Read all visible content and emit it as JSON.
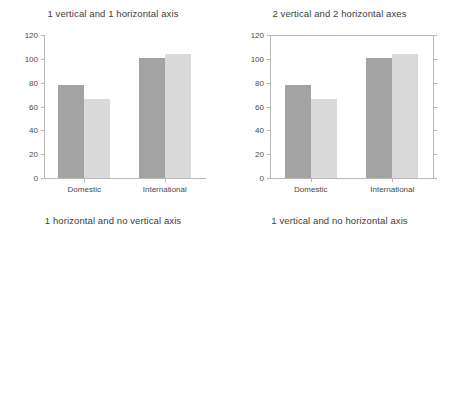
{
  "figure": {
    "layout": "2x2 grid of bar charts",
    "categories": [
      "Domestic",
      "International"
    ],
    "series": [
      {
        "name": "series-1",
        "color": "#a3a3a3",
        "values": [
          78,
          101
        ]
      },
      {
        "name": "series-2",
        "color": "#dadada",
        "values": [
          66,
          104
        ]
      }
    ],
    "y_ticks": [
      "0",
      "20",
      "40",
      "60",
      "80",
      "100",
      "120"
    ],
    "x_ticks": [
      "0",
      "20",
      "40",
      "60",
      "80",
      "100",
      "120"
    ]
  },
  "panels": {
    "top_left": {
      "title": "1 vertical and 1 horizontal axis"
    },
    "top_right": {
      "title": "2 vertical and 2 horizontal axes"
    },
    "bottom_left": {
      "title": "1 horizontal and no vertical axis"
    },
    "bottom_right": {
      "title": "1 vertical and no horizontal axis"
    }
  },
  "chart_data": [
    {
      "id": "top-left",
      "type": "bar",
      "orientation": "vertical",
      "title": "1 vertical and 1 horizontal axis",
      "categories": [
        "Domestic",
        "International"
      ],
      "series": [
        {
          "name": "series-1",
          "values": [
            78,
            101
          ]
        },
        {
          "name": "series-2",
          "values": [
            66,
            104
          ]
        }
      ],
      "xlabel": "",
      "ylabel": "",
      "ylim": [
        0,
        120
      ],
      "yticks": [
        0,
        20,
        40,
        60,
        80,
        100,
        120
      ],
      "grid": false,
      "legend": "none",
      "axes_shown": [
        "left",
        "bottom"
      ]
    },
    {
      "id": "top-right",
      "type": "bar",
      "orientation": "vertical",
      "title": "2 vertical and 2 horizontal axes",
      "categories": [
        "Domestic",
        "International"
      ],
      "series": [
        {
          "name": "series-1",
          "values": [
            78,
            101
          ]
        },
        {
          "name": "series-2",
          "values": [
            66,
            104
          ]
        }
      ],
      "xlabel": "",
      "ylabel": "",
      "ylim": [
        0,
        120
      ],
      "yticks": [
        0,
        20,
        40,
        60,
        80,
        100,
        120
      ],
      "grid": false,
      "legend": "none",
      "axes_shown": [
        "left",
        "right",
        "top",
        "bottom"
      ]
    },
    {
      "id": "bottom-left",
      "type": "bar",
      "orientation": "horizontal",
      "title": "1 horizontal and no vertical axis",
      "categories": [
        "Domestic",
        "International"
      ],
      "series": [
        {
          "name": "series-1",
          "values": [
            78,
            101
          ]
        },
        {
          "name": "series-2",
          "values": [
            66,
            104
          ]
        }
      ],
      "xlabel": "",
      "ylabel": "",
      "xlim": [
        0,
        120
      ],
      "xticks": [
        0,
        20,
        40,
        60,
        80,
        100,
        120
      ],
      "grid": false,
      "legend": "none",
      "axes_shown": [
        "bottom"
      ]
    },
    {
      "id": "bottom-right",
      "type": "bar",
      "orientation": "vertical",
      "title": "1 vertical and no horizontal axis",
      "categories": [
        "Domestic",
        "International"
      ],
      "series": [
        {
          "name": "series-1",
          "values": [
            78,
            101
          ]
        },
        {
          "name": "series-2",
          "values": [
            66,
            104
          ]
        }
      ],
      "xlabel": "",
      "ylabel": "",
      "ylim": [
        0,
        120
      ],
      "yticks": [
        0,
        20,
        40,
        60,
        80,
        100,
        120
      ],
      "grid": false,
      "legend": "none",
      "axes_shown": [
        "left"
      ]
    }
  ]
}
